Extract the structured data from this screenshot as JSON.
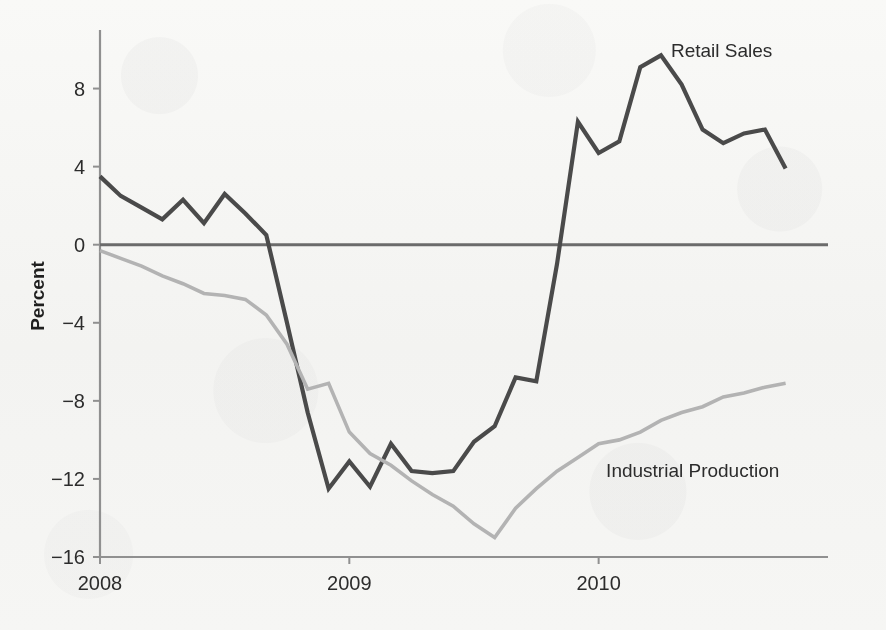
{
  "chart_data": {
    "type": "line",
    "title": "",
    "subtitle": "",
    "xlabel": "",
    "ylabel": "Percent",
    "xlim": [
      2008.0,
      2010.92
    ],
    "ylim": [
      -16,
      11
    ],
    "yticks": [
      8,
      4,
      0,
      -4,
      -8,
      -12,
      -16
    ],
    "ytick_labels": [
      "8",
      "4",
      "0",
      "−4",
      "−8",
      "−12",
      "−16"
    ],
    "xticks": [
      2008,
      2009,
      2010
    ],
    "xtick_labels": [
      "2008",
      "2009",
      "2010"
    ],
    "grid": false,
    "legend_position": "inline-annotations",
    "zero_line": 0,
    "x": [
      2008.0,
      2008.083,
      2008.167,
      2008.25,
      2008.333,
      2008.417,
      2008.5,
      2008.583,
      2008.667,
      2008.75,
      2008.833,
      2008.917,
      2009.0,
      2009.083,
      2009.167,
      2009.25,
      2009.333,
      2009.417,
      2009.5,
      2009.583,
      2009.667,
      2009.75,
      2009.833,
      2009.917,
      2010.0,
      2010.083,
      2010.167,
      2010.25,
      2010.333,
      2010.417,
      2010.5,
      2010.583,
      2010.667,
      2010.75
    ],
    "series": [
      {
        "name": "Retail Sales",
        "color": "#4a4a4a",
        "width": 4.2,
        "label_x": 2010.29,
        "label_y": 9.6,
        "values": [
          3.5,
          2.5,
          1.9,
          1.3,
          2.3,
          1.1,
          2.6,
          1.6,
          0.5,
          -4.0,
          -8.6,
          -12.5,
          -11.1,
          -12.4,
          -10.2,
          -11.6,
          -11.7,
          -11.6,
          -10.1,
          -9.3,
          -6.8,
          -7.0,
          -1.0,
          6.3,
          4.7,
          5.3,
          9.1,
          9.7,
          8.2,
          5.9,
          5.2,
          5.7,
          5.9,
          3.9
        ]
      },
      {
        "name": "Industrial Production",
        "color": "#b3b3b3",
        "width": 3.6,
        "label_x": 2010.03,
        "label_y": -11.9,
        "values": [
          -0.3,
          -0.7,
          -1.1,
          -1.6,
          -2.0,
          -2.5,
          -2.6,
          -2.8,
          -3.6,
          -5.1,
          -7.4,
          -7.1,
          -9.6,
          -10.7,
          -11.3,
          -12.1,
          -12.8,
          -13.4,
          -14.3,
          -15.0,
          -13.5,
          -12.5,
          -11.6,
          -10.9,
          -10.2,
          -10.0,
          -9.6,
          -9.0,
          -8.6,
          -8.3,
          -7.8,
          -7.6,
          -7.3,
          -7.1
        ]
      }
    ],
    "annotations": [
      {
        "text": "Retail Sales",
        "x": 2010.29,
        "y": 9.6
      },
      {
        "text": "Industrial Production",
        "x": 2010.03,
        "y": -11.9
      }
    ],
    "colors": {
      "retail_sales": "#4a4a4a",
      "industrial_production": "#b3b3b3",
      "axis": "#909090",
      "zero_line": "#6b6b6b",
      "text": "#2c2c2c",
      "background": "#fbfbfa"
    }
  },
  "geometry": {
    "plot_left": 100,
    "plot_right": 828,
    "plot_top": 30,
    "plot_bottom": 557,
    "y_zero_px": 236,
    "px_per_unit_y": 19.7,
    "px_per_year_x": 281.5
  }
}
